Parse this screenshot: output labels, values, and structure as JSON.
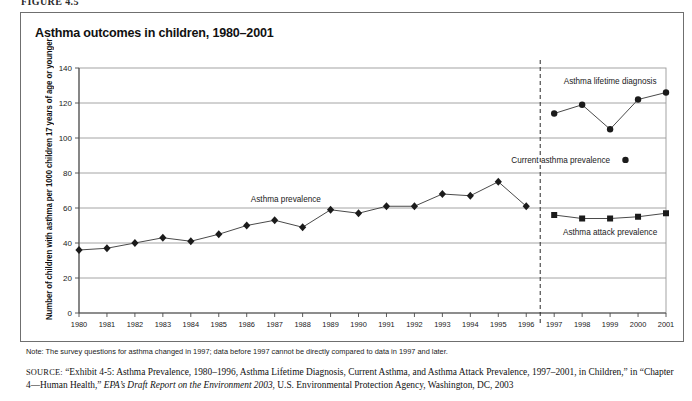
{
  "figure": {
    "label": "FIGURE 4.5",
    "title": "Asthma outcomes in children, 1980–2001"
  },
  "axes": {
    "ylabel": "Number of children with asthma per 1000 children 17 years of age or younger",
    "yticks": [
      "0",
      "20",
      "40",
      "60",
      "80",
      "100",
      "120",
      "140"
    ],
    "ylim": [
      0,
      140
    ],
    "xticks": [
      "1980",
      "1981",
      "1982",
      "1983",
      "1984",
      "1985",
      "1986",
      "1987",
      "1988",
      "1989",
      "1990",
      "1991",
      "1992",
      "1993",
      "1994",
      "1995",
      "1996",
      "1997",
      "1998",
      "1999",
      "2000",
      "2001"
    ]
  },
  "annotations": {
    "prevalence_label": "Asthma prevalence",
    "lifetime_label": "Asthma lifetime diagnosis",
    "current_label": "Current asthma prevalence",
    "attack_label": "Asthma attack prevalence",
    "break_year": "1997"
  },
  "note": {
    "text": "Note: The survey questions for asthma changed in 1997; data before 1997 cannot be directly compared to data in 1997 and later."
  },
  "source": {
    "prefix": "SOURCE:",
    "line1": " “Exhibit 4-5: Asthma Prevalence, 1980–1996, Asthma Lifetime Diagnosis, Current Asthma, and Asthma Attack Prevalence, 1997–2001, in Children,” in “Chapter 4—Human Health,” ",
    "italic": "EPA’s Draft Report on the Environment 2003",
    "line2": ", U.S. Environmental Protection Agency, Washington, DC, 2003"
  },
  "colors": {
    "marker": "#1b1b1b",
    "line": "#4a4a4a",
    "grid": "#9a9a9a",
    "axis": "#4a4a4a",
    "border": "#6f6f6f"
  },
  "chart_data": {
    "type": "line",
    "title": "Asthma outcomes in children, 1980–2001",
    "xlabel": "",
    "ylabel": "Number of children with asthma per 1000 children 17 years of age or younger",
    "ylim": [
      0,
      140
    ],
    "ytick_step": 20,
    "grid": true,
    "legend": "inline annotations",
    "x": [
      1980,
      1981,
      1982,
      1983,
      1984,
      1985,
      1986,
      1987,
      1988,
      1989,
      1990,
      1991,
      1992,
      1993,
      1994,
      1995,
      1996,
      1997,
      1998,
      1999,
      2000,
      2001
    ],
    "series": [
      {
        "name": "Asthma prevalence",
        "marker": "diamond",
        "x": [
          1980,
          1981,
          1982,
          1983,
          1984,
          1985,
          1986,
          1987,
          1988,
          1989,
          1990,
          1991,
          1992,
          1993,
          1994,
          1995,
          1996
        ],
        "values": [
          36,
          37,
          40,
          43,
          41,
          45,
          50,
          53,
          49,
          59,
          57,
          61,
          61,
          68,
          67,
          75,
          61
        ]
      },
      {
        "name": "Asthma lifetime diagnosis",
        "marker": "circle",
        "x": [
          1997,
          1998,
          1999,
          2000,
          2001
        ],
        "values": [
          114,
          119,
          105,
          122,
          126
        ]
      },
      {
        "name": "Asthma attack prevalence",
        "marker": "square",
        "x": [
          1997,
          1998,
          1999,
          2000,
          2001
        ],
        "values": [
          56,
          54,
          54,
          55,
          57
        ]
      }
    ],
    "vline": {
      "x": 1996.5,
      "style": "dashed",
      "label": "survey change 1997"
    }
  }
}
